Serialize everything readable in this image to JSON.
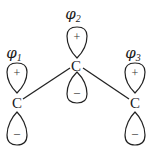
{
  "diagram": {
    "orbitals": [
      {
        "id": "phi1",
        "label_symbol": "φ",
        "label_subscript": "1",
        "atom": "C",
        "upper_sign": "+",
        "lower_sign": "–"
      },
      {
        "id": "phi2",
        "label_symbol": "φ",
        "label_subscript": "2",
        "atom": "C",
        "upper_sign": "+",
        "lower_sign": "–"
      },
      {
        "id": "phi3",
        "label_symbol": "φ",
        "label_subscript": "3",
        "atom": "C",
        "upper_sign": "+",
        "lower_sign": "–"
      }
    ],
    "bonds": [
      {
        "from": "phi2",
        "to": "phi1"
      },
      {
        "from": "phi2",
        "to": "phi3"
      }
    ],
    "colors": {
      "stroke": "#222222",
      "background": "#ffffff"
    }
  }
}
